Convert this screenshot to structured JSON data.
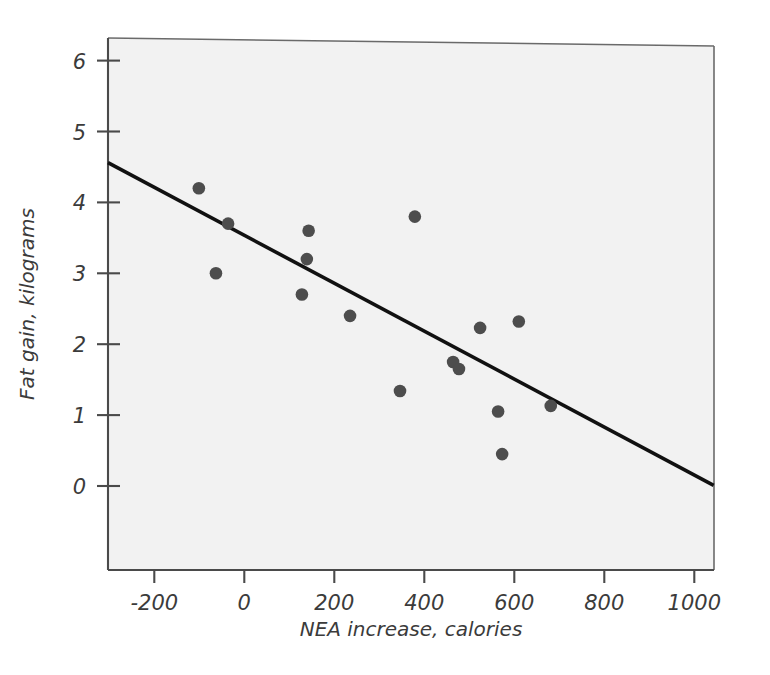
{
  "chart_data": {
    "type": "scatter",
    "title": "",
    "xlabel": "NEA increase, calories",
    "ylabel": "Fat gain, kilograms",
    "xlim": [
      -303,
      1043
    ],
    "ylim": [
      -0.62,
      6.3
    ],
    "grid": false,
    "legend": null,
    "xticks": [
      -200,
      0,
      200,
      400,
      600,
      800,
      1000
    ],
    "xtick_labels": [
      "-200",
      "0",
      "200",
      "400",
      "600",
      "800",
      "1000"
    ],
    "yticks": [
      0,
      1,
      2,
      3,
      4,
      5,
      6
    ],
    "ytick_labels": [
      "0",
      "1",
      "2",
      "3",
      "4",
      "5",
      "6"
    ],
    "point_color": "#4d4d4d",
    "line_color": "#111111",
    "background_color": "#f2f2f2",
    "points": [
      {
        "x": -101,
        "y": 4.2
      },
      {
        "x": -63,
        "y": 3.0
      },
      {
        "x": -36,
        "y": 3.7
      },
      {
        "x": 128,
        "y": 2.7
      },
      {
        "x": 139,
        "y": 3.2
      },
      {
        "x": 143,
        "y": 3.6
      },
      {
        "x": 235,
        "y": 2.4
      },
      {
        "x": 346,
        "y": 1.34
      },
      {
        "x": 379,
        "y": 3.8
      },
      {
        "x": 464,
        "y": 1.75
      },
      {
        "x": 477,
        "y": 1.65
      },
      {
        "x": 524,
        "y": 2.23
      },
      {
        "x": 564,
        "y": 1.05
      },
      {
        "x": 573,
        "y": 0.45
      },
      {
        "x": 610,
        "y": 2.32
      },
      {
        "x": 681,
        "y": 1.13
      }
    ],
    "fit_line": {
      "name": "least-squares regression line",
      "slope": -0.00338,
      "intercept": 3.54,
      "x_start": -303,
      "y_start": 4.56,
      "x_end": 1043,
      "y_end": 0.01
    }
  }
}
